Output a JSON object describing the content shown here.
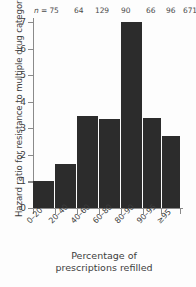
{
  "chart_data": {
    "type": "bar",
    "title": "",
    "categories": [
      "0–20",
      "20–40",
      "40–60",
      "60–80",
      "80–90",
      "90–95",
      "≥95"
    ],
    "values": [
      1.0,
      1.67,
      3.45,
      3.35,
      7.0,
      3.4,
      2.7
    ],
    "point_labels": [
      "n = 75",
      "64",
      "129",
      "90",
      "66",
      "96",
      "671"
    ],
    "n_values": [
      75,
      64,
      129,
      90,
      66,
      96,
      671
    ],
    "n_prefix": "n = ",
    "xlabel": "Percentage of prescriptions refilled",
    "ylabel": "Hazard ratio for resistance to multiple drug categories",
    "ylim": [
      0,
      7
    ],
    "ytick_labels": [
      "0",
      "1",
      "2",
      "3",
      "4",
      "5",
      "6",
      "7"
    ],
    "ytick_values": [
      0,
      1,
      2,
      3,
      4,
      5,
      6,
      7
    ],
    "grid": false,
    "legend": "none",
    "bar_color": "#2c2c2c",
    "axis_color": "#8a8a8a",
    "background_color": "#fdfdfd"
  },
  "axes": {
    "y_title": "Hazard ratio for resistance to multiple drug categories",
    "x_title_line1": "Percentage of",
    "x_title_line2": "prescriptions refilled"
  },
  "caption": {
    "sliver_text": ""
  }
}
